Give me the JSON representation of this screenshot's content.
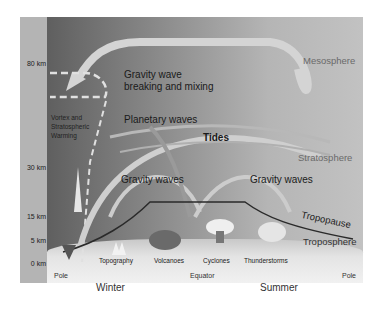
{
  "diagram": {
    "altitudes": [
      "80 km",
      "30 km",
      "15 km",
      "5 km",
      "0 km"
    ],
    "regions": {
      "mesosphere": "Mesosphere",
      "stratosphere": "Stratosphere",
      "tropopause": "Tropopause",
      "troposphere": "Troposphere"
    },
    "processes": {
      "gw_breaking_line1": "Gravity wave",
      "gw_breaking_line2": "breaking  and mixing",
      "vortex_line1": "Vortex and",
      "vortex_line2": "Stratospheric",
      "vortex_line3": "Warming",
      "planetary_waves": "Planetary waves",
      "tides": "Tides",
      "gravity_waves_left": "Gravity waves",
      "gravity_waves_right": "Gravity waves"
    },
    "sources": [
      "Topography",
      "Volcanoes",
      "Cyclones",
      "Thunderstorms"
    ],
    "ground": {
      "pole_left": "Pole",
      "equator": "Equator",
      "pole_right": "Pole"
    },
    "seasons": {
      "left": "Winter",
      "right": "Summer"
    },
    "colors": {
      "panel_dark": "#5f5f5f",
      "panel_light": "#c2c2c2",
      "arrow": "#d8d8d8",
      "tropopause_line": "#2a2a2a",
      "axis_column": "#b4b4b4"
    }
  }
}
